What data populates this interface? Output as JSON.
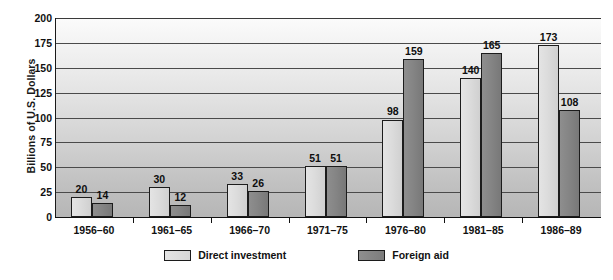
{
  "chart_data": {
    "type": "bar",
    "title": "",
    "subtitle": "",
    "xlabel": "",
    "ylabel": "Billions of U.S. Dollars",
    "categories": [
      "1956–60",
      "1961–65",
      "1966–70",
      "1971–75",
      "1976–80",
      "1981–85",
      "1986–89"
    ],
    "series": [
      {
        "name": "Direct investment",
        "values": [
          20,
          30,
          33,
          51,
          98,
          140,
          173
        ],
        "color": "#d8d8d8"
      },
      {
        "name": "Foreign aid",
        "values": [
          14,
          12,
          26,
          51,
          159,
          165,
          108
        ],
        "color": "#828282"
      }
    ],
    "ylim": [
      0,
      200
    ],
    "yticks": [
      0,
      25,
      50,
      75,
      100,
      125,
      150,
      175,
      200
    ],
    "ytick_labels": [
      "0",
      "25",
      "50",
      "75",
      "100",
      "125",
      "150",
      "175",
      "200"
    ],
    "grid": true,
    "grid_axis": "y",
    "legend_position": "bottom-center",
    "data_labels": true,
    "bar_border_color": "#1c1c1c",
    "plot_background": "vertical-gradient-white-to-gray"
  },
  "legend": {
    "items": [
      {
        "label": "Direct investment",
        "swatch": "light-gray-swatch"
      },
      {
        "label": "Foreign aid",
        "swatch": "dark-gray-swatch"
      }
    ]
  }
}
